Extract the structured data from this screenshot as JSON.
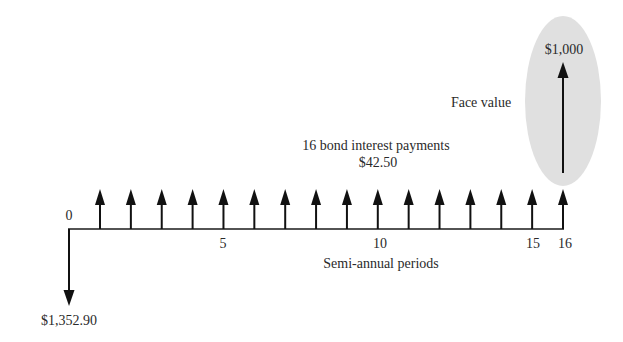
{
  "diagram": {
    "type": "cash-flow-timeline",
    "origin_label": "0",
    "initial_outflow": {
      "label": "$1,352.90",
      "direction": "down"
    },
    "axis": {
      "title": "Semi-annual periods",
      "tick_labels": [
        {
          "period": 5,
          "label": "5"
        },
        {
          "period": 10,
          "label": "10"
        },
        {
          "period": 15,
          "label": "15"
        },
        {
          "period": 16,
          "label": "16"
        }
      ],
      "periods": 16
    },
    "interest_payments": {
      "title": "16 bond interest payments",
      "amount": "$42.50",
      "count": 16,
      "direction": "up"
    },
    "face_value": {
      "label": "Face value",
      "amount": "$1,000",
      "period": 16,
      "highlight_color": "#e0e0e0"
    }
  }
}
